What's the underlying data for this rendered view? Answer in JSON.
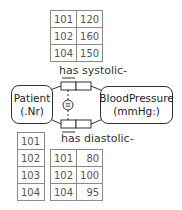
{
  "diagram": {
    "entities": {
      "patient": {
        "name": "Patient",
        "ref": "(.Nr)"
      },
      "blood_pressure": {
        "name": "BloodPressure",
        "ref": "(mmHg:)"
      }
    },
    "fact_types": {
      "systolic": {
        "reading": "has systolic-"
      },
      "diastolic": {
        "reading": "has diastolic-"
      }
    },
    "constraint_symbol": "=",
    "tables": {
      "systolic_population": {
        "rows": [
          [
            "101",
            "120"
          ],
          [
            "102",
            "160"
          ],
          [
            "104",
            "150"
          ]
        ]
      },
      "diastolic_population": {
        "rows": [
          [
            "101",
            "80"
          ],
          [
            "102",
            "100"
          ],
          [
            "104",
            "95"
          ]
        ]
      },
      "patient_population": {
        "rows": [
          "101",
          "102",
          "103",
          "104"
        ]
      }
    },
    "colors": {
      "line": "#333333",
      "table_border": "#8a8a8a",
      "table_text": "#555555"
    }
  }
}
